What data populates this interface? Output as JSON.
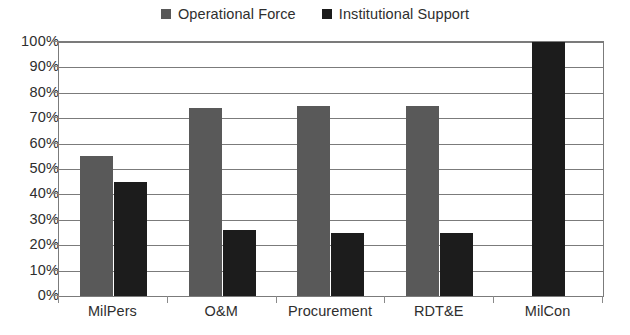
{
  "chart_data": {
    "type": "bar",
    "title": "",
    "subtitle": "",
    "xlabel": "",
    "ylabel": "",
    "categories": [
      "MilPers",
      "O&M",
      "Procurement",
      "RDT&E",
      "MilCon"
    ],
    "series": [
      {
        "name": "Operational Force",
        "color": "#595959",
        "values": [
          55,
          74,
          75,
          75,
          0
        ]
      },
      {
        "name": "Institutional Support",
        "color": "#1c1c1c",
        "values": [
          45,
          26,
          25,
          25,
          100
        ]
      }
    ],
    "ylim": [
      0,
      100
    ],
    "ytick_labels": [
      "0%",
      "10%",
      "20%",
      "30%",
      "40%",
      "50%",
      "60%",
      "70%",
      "80%",
      "90%",
      "100%"
    ],
    "ytick_values": [
      0,
      10,
      20,
      30,
      40,
      50,
      60,
      70,
      80,
      90,
      100
    ],
    "grid": true,
    "legend_position": "top-center",
    "value_unit": "percent"
  },
  "legend": {
    "entries": [
      {
        "label": "Operational Force",
        "swatch": "#595959",
        "icon": "legend-square-gray"
      },
      {
        "label": "Institutional Support",
        "swatch": "#1c1c1c",
        "icon": "legend-square-black"
      }
    ]
  },
  "colors": {
    "operational_force": "#595959",
    "institutional_support": "#1c1c1c",
    "axis": "#7b7b7b",
    "text": "#2e2e2e",
    "background": "#ffffff"
  }
}
